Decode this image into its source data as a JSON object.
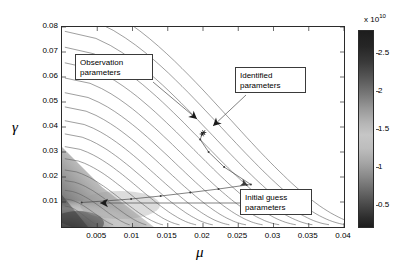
{
  "chart_data": {
    "type": "contour",
    "title": "",
    "xlabel": "μ",
    "ylabel": "γ",
    "xlim": [
      0.0,
      0.04
    ],
    "ylim": [
      0.0,
      0.08
    ],
    "xticks": [
      0.005,
      0.01,
      0.015,
      0.02,
      0.025,
      0.03,
      0.035,
      0.04
    ],
    "xticklabels": [
      "0.005",
      "0.01",
      "0.015",
      "0.02",
      "0.025",
      "0.03",
      "0.035",
      "0.04"
    ],
    "yticks": [
      0.01,
      0.02,
      0.03,
      0.04,
      0.05,
      0.06,
      0.07,
      0.08
    ],
    "yticklabels": [
      "0.01",
      "0.02",
      "0.03",
      "0.04",
      "0.05",
      "0.06",
      "0.07",
      "0.08"
    ],
    "grid": false,
    "legend": false,
    "colormap": "grayscale",
    "colorbar": {
      "exponent_label": "x 10",
      "exponent_value": "10",
      "ticks": [
        0.5,
        1,
        1.5,
        2,
        2.5
      ],
      "ticklabels": [
        "0.5",
        "1",
        "1.5",
        "2",
        "2.5"
      ],
      "min": 0.2,
      "max": 2.8,
      "orientation": "vertical",
      "position": "right"
    },
    "markers": [
      {
        "name": "observation-parameters-point",
        "x": 0.0201,
        "y": 0.0378
      },
      {
        "name": "identified-parameters-point",
        "x": 0.0199,
        "y": 0.0372
      }
    ],
    "trajectory": {
      "name": "optimization-path",
      "points": [
        [
          0.0028,
          0.0098
        ],
        [
          0.006,
          0.0104
        ],
        [
          0.0098,
          0.0112
        ],
        [
          0.014,
          0.0124
        ],
        [
          0.0182,
          0.0138
        ],
        [
          0.0222,
          0.0152
        ],
        [
          0.0262,
          0.0168
        ],
        [
          0.0268,
          0.017
        ],
        [
          0.023,
          0.024
        ],
        [
          0.0208,
          0.03
        ],
        [
          0.0196,
          0.035
        ],
        [
          0.0199,
          0.0372
        ]
      ]
    },
    "contour_levels": [
      0.3,
      0.45,
      0.6,
      0.75,
      0.9,
      1.05,
      1.2,
      1.35,
      1.5,
      1.65,
      1.8,
      1.95,
      2.1,
      2.25,
      2.4,
      2.55,
      2.7
    ],
    "valley": {
      "description": "low-cost dark band along lower-left diagonal"
    }
  },
  "annotations": [
    {
      "name": "observation-parameters-callout",
      "line1": "Observation",
      "line2": "parameters",
      "box": {
        "left": 75,
        "top": 54,
        "width": 78,
        "height": 26
      },
      "arrow": {
        "x1": 152,
        "y1": 81,
        "x2": 196,
        "y2": 118
      }
    },
    {
      "name": "identified-parameters-callout",
      "line1": "Identified",
      "line2": "parameters",
      "box": {
        "left": 235,
        "top": 67,
        "width": 71,
        "height": 26
      },
      "arrow": {
        "x1": 245,
        "y1": 94,
        "x2": 212,
        "y2": 125
      }
    },
    {
      "name": "initial-guess-parameters-callout",
      "line1": "Initial guess",
      "line2": "parameters",
      "box": {
        "left": 240,
        "top": 189,
        "width": 72,
        "height": 26
      },
      "arrow": {
        "x1": 239,
        "y1": 202,
        "x2": 99,
        "y2": 202
      }
    }
  ]
}
